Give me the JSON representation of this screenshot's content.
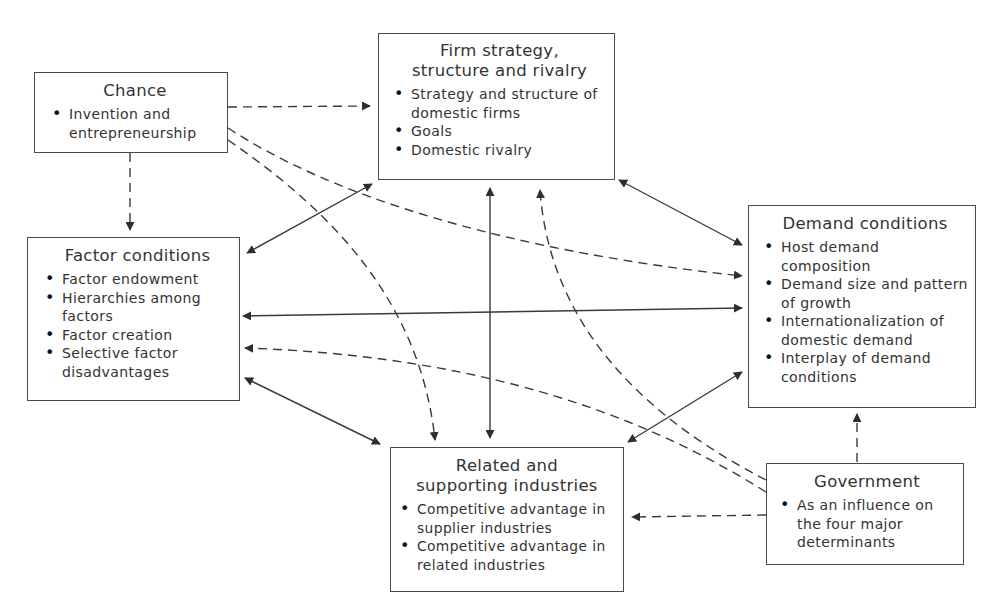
{
  "diagram": {
    "type": "Porter's Diamond - determinants of national competitive advantage",
    "nodes": {
      "chance": {
        "title": "Chance",
        "items": [
          "Invention and entrepreneurship"
        ]
      },
      "firm": {
        "title_line1": "Firm strategy,",
        "title_line2": "structure and rivalry",
        "items": [
          "Strategy and structure of domestic firms",
          "Goals",
          "Domestic rivalry"
        ]
      },
      "factor": {
        "title": "Factor conditions",
        "items": [
          "Factor endowment",
          "Hierarchies among factors",
          "Factor creation",
          "Selective factor disadvantages"
        ]
      },
      "demand": {
        "title": "Demand conditions",
        "items": [
          "Host demand composition",
          "Demand size and pattern of growth",
          "Internationalization of domestic demand",
          "Interplay of demand conditions"
        ]
      },
      "related": {
        "title_line1": "Related and",
        "title_line2": "supporting industries",
        "items": [
          "Competitive advantage in supplier industries",
          "Competitive advantage in related industries"
        ]
      },
      "government": {
        "title": "Government",
        "items": [
          "As an influence on the four major determinants"
        ]
      }
    },
    "edges": [
      {
        "from": "Chance",
        "to": "Firm strategy, structure and rivalry",
        "style": "dashed",
        "direction": "one-way"
      },
      {
        "from": "Chance",
        "to": "Factor conditions",
        "style": "dashed",
        "direction": "one-way"
      },
      {
        "from": "Chance",
        "to": "Demand conditions",
        "style": "dashed",
        "direction": "one-way"
      },
      {
        "from": "Chance",
        "to": "Related and supporting industries",
        "style": "dashed",
        "direction": "one-way"
      },
      {
        "from": "Firm strategy, structure and rivalry",
        "to": "Factor conditions",
        "style": "solid",
        "direction": "two-way"
      },
      {
        "from": "Firm strategy, structure and rivalry",
        "to": "Demand conditions",
        "style": "solid",
        "direction": "two-way"
      },
      {
        "from": "Firm strategy, structure and rivalry",
        "to": "Related and supporting industries",
        "style": "solid",
        "direction": "two-way"
      },
      {
        "from": "Factor conditions",
        "to": "Demand conditions",
        "style": "solid",
        "direction": "two-way"
      },
      {
        "from": "Factor conditions",
        "to": "Related and supporting industries",
        "style": "solid",
        "direction": "two-way"
      },
      {
        "from": "Demand conditions",
        "to": "Related and supporting industries",
        "style": "solid",
        "direction": "two-way"
      },
      {
        "from": "Government",
        "to": "Firm strategy, structure and rivalry",
        "style": "dashed",
        "direction": "one-way"
      },
      {
        "from": "Government",
        "to": "Factor conditions",
        "style": "dashed",
        "direction": "one-way"
      },
      {
        "from": "Government",
        "to": "Demand conditions",
        "style": "dashed",
        "direction": "one-way"
      },
      {
        "from": "Government",
        "to": "Related and supporting industries",
        "style": "dashed",
        "direction": "one-way"
      }
    ],
    "colors": {
      "line": "#3a3a3a",
      "border": "#4a4a4a",
      "background": "#ffffff"
    }
  }
}
